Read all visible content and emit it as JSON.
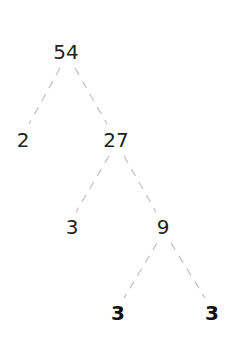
{
  "colors": {
    "text": "#222222",
    "edge": "#c4c4c4",
    "background": "#ffffff"
  },
  "nodes": [
    {
      "id": "n54",
      "label": "54",
      "x": 66,
      "y": 52,
      "bold": false
    },
    {
      "id": "n2",
      "label": "2",
      "x": 23,
      "y": 140,
      "bold": false
    },
    {
      "id": "n27",
      "label": "27",
      "x": 116,
      "y": 140,
      "bold": false
    },
    {
      "id": "n3a",
      "label": "3",
      "x": 72,
      "y": 227,
      "bold": false
    },
    {
      "id": "n9",
      "label": "9",
      "x": 163,
      "y": 227,
      "bold": false
    },
    {
      "id": "n3b",
      "label": "3",
      "x": 118,
      "y": 313,
      "bold": true
    },
    {
      "id": "n3c",
      "label": "3",
      "x": 212,
      "y": 313,
      "bold": true
    }
  ],
  "edges": [
    {
      "from": "n54",
      "to": "n2",
      "x1": 60,
      "y1": 68,
      "x2": 29,
      "y2": 124
    },
    {
      "from": "n54",
      "to": "n27",
      "x1": 75,
      "y1": 68,
      "x2": 107,
      "y2": 124
    },
    {
      "from": "n27",
      "to": "n3a",
      "x1": 109,
      "y1": 156,
      "x2": 76,
      "y2": 212
    },
    {
      "from": "n27",
      "to": "n9",
      "x1": 124,
      "y1": 156,
      "x2": 156,
      "y2": 212
    },
    {
      "from": "n9",
      "to": "n3b",
      "x1": 157,
      "y1": 243,
      "x2": 124,
      "y2": 298
    },
    {
      "from": "n9",
      "to": "n3c",
      "x1": 171,
      "y1": 243,
      "x2": 205,
      "y2": 298
    }
  ]
}
